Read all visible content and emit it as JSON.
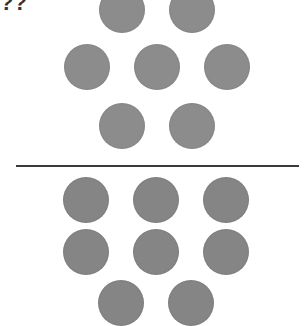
{
  "fragment_text": "??",
  "colors": {
    "top_dots": "#8c8c8c",
    "bottom_dots": "#858585",
    "divider": "#3a3a3a",
    "background": "#ffffff"
  },
  "top_group": {
    "count": 7,
    "dots": [
      {
        "cx": 122,
        "cy": 10
      },
      {
        "cx": 192,
        "cy": 10
      },
      {
        "cx": 87,
        "cy": 67
      },
      {
        "cx": 157,
        "cy": 67
      },
      {
        "cx": 227,
        "cy": 67
      },
      {
        "cx": 122,
        "cy": 126
      },
      {
        "cx": 192,
        "cy": 126
      }
    ]
  },
  "bottom_group": {
    "count": 8,
    "dots": [
      {
        "cx": 86,
        "cy": 200
      },
      {
        "cx": 156,
        "cy": 200
      },
      {
        "cx": 226,
        "cy": 200
      },
      {
        "cx": 86,
        "cy": 252
      },
      {
        "cx": 156,
        "cy": 252
      },
      {
        "cx": 226,
        "cy": 252
      },
      {
        "cx": 121,
        "cy": 303
      },
      {
        "cx": 191,
        "cy": 303
      }
    ]
  }
}
